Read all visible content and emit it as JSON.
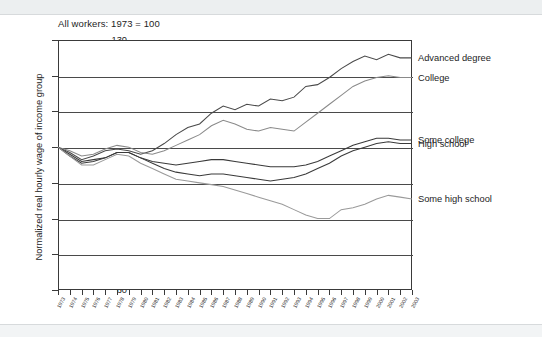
{
  "chart_data": {
    "type": "line",
    "title": "All workers: 1973 = 100",
    "xlabel": "",
    "ylabel": "Normalized real hourly wage of income group",
    "ylim": [
      60,
      130
    ],
    "yticks": [
      60,
      70,
      80,
      90,
      100,
      110,
      120,
      130
    ],
    "grid": true,
    "legend_position": "right-inline",
    "x": [
      1973,
      1974,
      1975,
      1976,
      1977,
      1978,
      1979,
      1980,
      1981,
      1982,
      1983,
      1984,
      1985,
      1986,
      1987,
      1988,
      1989,
      1990,
      1991,
      1992,
      1993,
      1994,
      1995,
      1996,
      1997,
      1998,
      1999,
      2000,
      2001,
      2002,
      2003
    ],
    "series": [
      {
        "name": "Advanced degree",
        "color": "#4a4a4a",
        "label_value": 125,
        "values": [
          100,
          98.5,
          96.5,
          97.5,
          99,
          99.5,
          99,
          98,
          99,
          101,
          103.5,
          105.5,
          106.5,
          109.5,
          111.5,
          110.5,
          112,
          111.5,
          113.5,
          113,
          114,
          117,
          117.5,
          119.5,
          122,
          124,
          125.5,
          124.5,
          126,
          125,
          125
        ]
      },
      {
        "name": "College",
        "color": "#8a8a8a",
        "label_value": 119.5,
        "values": [
          100,
          99,
          97.5,
          98,
          99.5,
          100.5,
          100,
          98.5,
          98,
          99,
          100.5,
          102,
          103.5,
          106,
          107.5,
          106.5,
          105,
          104.5,
          105.5,
          105,
          104.5,
          107,
          109.5,
          112,
          114.5,
          117,
          118.5,
          119.5,
          120,
          119.5,
          119.5
        ]
      },
      {
        "name": "Some college",
        "color": "#3a3a3a",
        "label_value": 102,
        "values": [
          100,
          98,
          96,
          96.5,
          97,
          98.5,
          98.5,
          97,
          96,
          95.5,
          95,
          95.5,
          96,
          96.5,
          96.5,
          96,
          95.5,
          95,
          94.5,
          94.5,
          94.5,
          95,
          96,
          97.5,
          99,
          100.5,
          101.5,
          102.5,
          102.5,
          102,
          102
        ]
      },
      {
        "name": "High school",
        "color": "#3a3a3a",
        "label_value": 101,
        "values": [
          100,
          97.5,
          95.5,
          96,
          97,
          98.5,
          98.5,
          97,
          95.5,
          94,
          93,
          92.5,
          92,
          92.5,
          92.5,
          92,
          91.5,
          91,
          90.5,
          91,
          91.5,
          92.5,
          94,
          95.5,
          97.5,
          99,
          100,
          101,
          101.5,
          101,
          101
        ]
      },
      {
        "name": "Some high school",
        "color": "#9a9a9a",
        "label_value": 85.5,
        "values": [
          100,
          97.5,
          95,
          95,
          96.5,
          98,
          97.5,
          95.5,
          94,
          92.5,
          91,
          90.5,
          90,
          89.5,
          89,
          88,
          87,
          86,
          85,
          84,
          82.5,
          81,
          80,
          80,
          82.5,
          83,
          84,
          85.5,
          86.5,
          86,
          85.5
        ]
      }
    ],
    "series_labels": [
      {
        "name": "Advanced degree",
        "value": 125
      },
      {
        "name": "College",
        "value": 119.5
      },
      {
        "name": "Some college",
        "value": 102
      },
      {
        "name": "High school",
        "value": 101
      },
      {
        "name": "Some high school",
        "value": 85.5
      }
    ]
  }
}
